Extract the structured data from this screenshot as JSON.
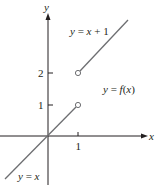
{
  "figure": {
    "type": "piecewise-function-graph",
    "axes": {
      "x_label": "x",
      "y_label": "y",
      "x_ticks": [
        {
          "value": 1,
          "label": "1"
        }
      ],
      "y_ticks": [
        {
          "value": 1,
          "label": "1"
        },
        {
          "value": 2,
          "label": "2"
        }
      ]
    },
    "labels": {
      "upper_piece": "y = x + 1",
      "lower_piece": "y = x",
      "function": "y = f(x)"
    },
    "pieces": [
      {
        "name": "lower",
        "equation": "y = x",
        "domain": "x < 1",
        "endpoint": {
          "x": 1,
          "y": 1,
          "type": "open"
        }
      },
      {
        "name": "upper",
        "equation": "y = x + 1",
        "domain": "x > 1",
        "endpoint": {
          "x": 1,
          "y": 2,
          "type": "open"
        }
      }
    ],
    "colors": {
      "axis": "#231f20",
      "curve": "#6d6e71",
      "text": "#231f20"
    }
  }
}
